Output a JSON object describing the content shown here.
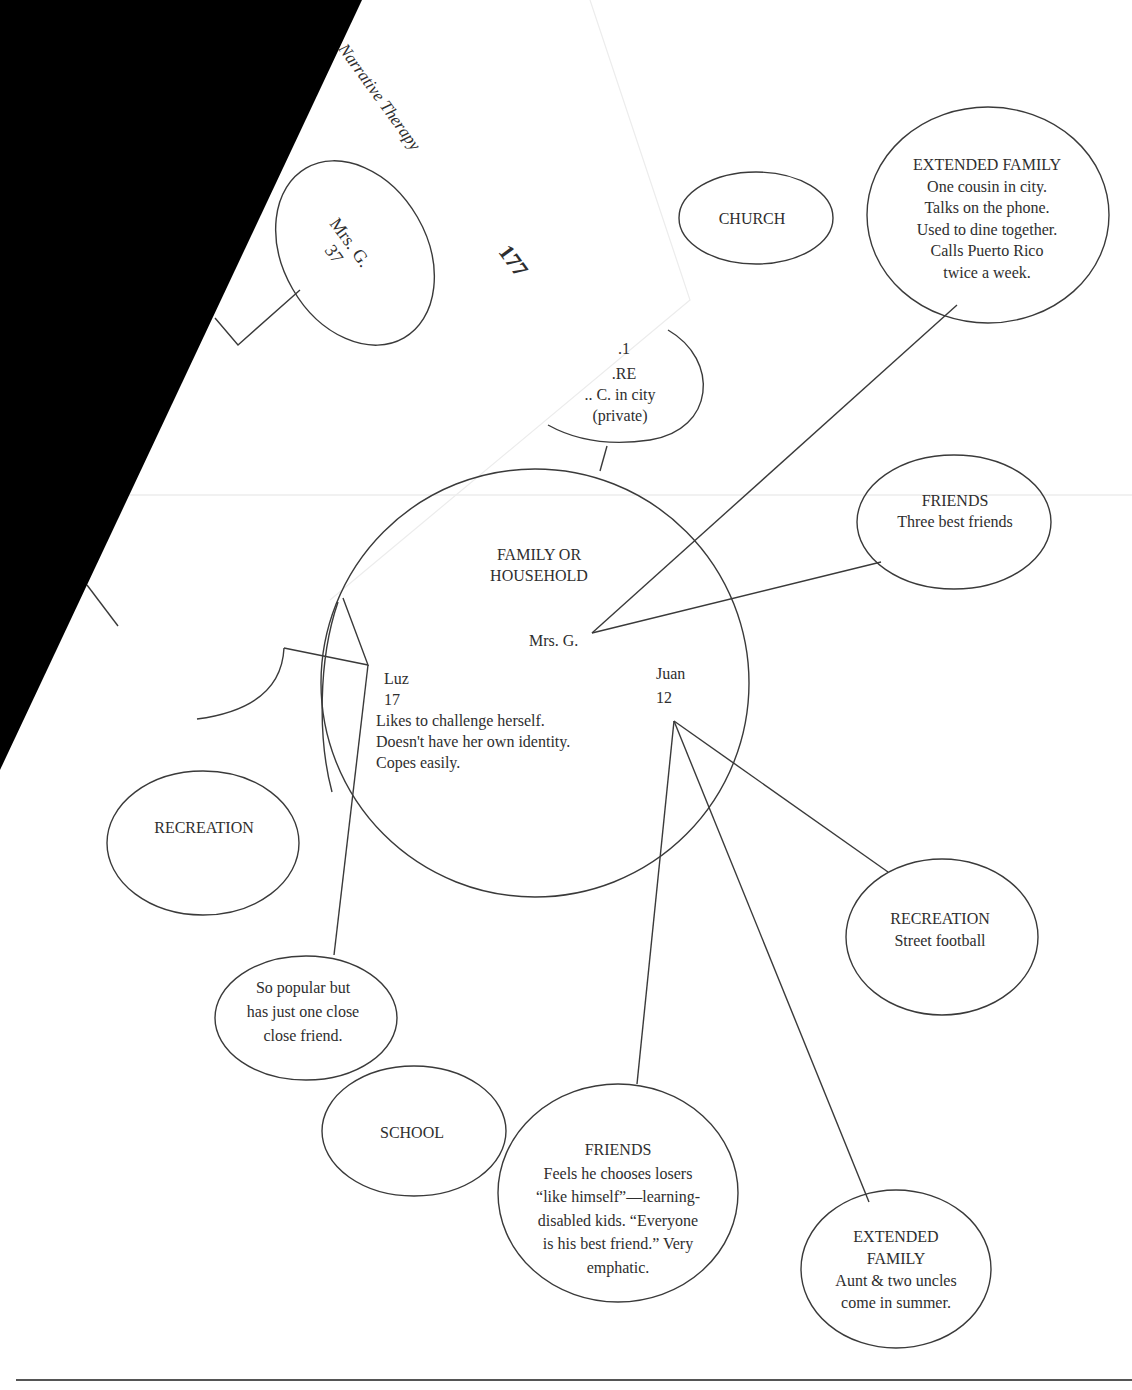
{
  "page": {
    "header_text": "Narrative Therapy",
    "page_number": "177"
  },
  "diagram": {
    "title_center": {
      "lines": [
        "FAMILY OR",
        "HOUSEHOLD"
      ]
    },
    "members": {
      "mrs_g_inner": "Mrs. G.",
      "luz": {
        "name": "Luz",
        "age": "17",
        "notes": [
          "Likes to challenge herself.",
          "Doesn't have her own identity.",
          "Copes easily."
        ]
      },
      "juan": {
        "name": "Juan",
        "age": "12"
      }
    },
    "overlay_page": {
      "mrs_g_oval": {
        "lines": [
          "Mrs. G.",
          "37"
        ]
      },
      "child_care_partial": {
        "lines": [
          ".1",
          ".RE",
          ".. C. in city",
          "(private)"
        ]
      }
    },
    "nodes": [
      {
        "id": "church",
        "lines": [
          "CHURCH"
        ]
      },
      {
        "id": "extended-family-mrs-g",
        "lines": [
          "EXTENDED FAMILY",
          "One cousin in city.",
          "Talks on the phone.",
          "Used to dine together.",
          "Calls Puerto Rico",
          "twice a week."
        ]
      },
      {
        "id": "friends-mrs-g",
        "lines": [
          "FRIENDS",
          "Three best friends"
        ]
      },
      {
        "id": "recreation-luz",
        "lines": [
          "RECREATION"
        ]
      },
      {
        "id": "friends-luz",
        "lines": [
          "So popular but",
          "has just one close",
          "close friend."
        ]
      },
      {
        "id": "school",
        "lines": [
          "SCHOOL"
        ]
      },
      {
        "id": "friends-juan",
        "lines": [
          "FRIENDS",
          "Feels he chooses losers",
          "“like himself”—learning-",
          "disabled kids. “Everyone",
          "is his best friend.” Very",
          "emphatic."
        ]
      },
      {
        "id": "recreation-juan",
        "lines": [
          "RECREATION",
          "Street football"
        ]
      },
      {
        "id": "extended-family-juan",
        "lines": [
          "EXTENDED",
          "FAMILY",
          "Aunt & two uncles",
          "come in summer."
        ]
      }
    ]
  },
  "colors": {
    "ink": "#2e2e2e",
    "paper": "#ffffff",
    "occluder": "#000000"
  }
}
